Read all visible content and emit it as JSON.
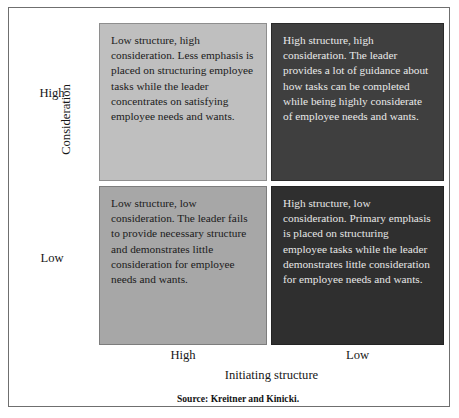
{
  "figure": {
    "axes": {
      "y_title": "Consideration",
      "y_ticks": {
        "high": "High",
        "low": "Low"
      },
      "x_title": "Initiating structure",
      "x_ticks": {
        "high": "High",
        "low": "Low"
      }
    },
    "quadrants": {
      "low_structure_high_consideration": "Low structure, high consideration. Less emphasis is placed on structuring employee tasks while the leader concentrates on satisfying employee needs and wants.",
      "high_structure_high_consideration": "High structure, high consideration. The leader provides a lot of guidance about how tasks can be completed while being highly considerate of employee needs and wants.",
      "low_structure_low_consideration": "Low structure, low consideration. The leader fails to provide necessary structure and demonstrates little consideration for employee needs and wants.",
      "high_structure_low_consideration": "High structure, low consideration. Primary emphasis is placed on structuring employee tasks while the leader demonstrates little consideration for employee needs and wants."
    },
    "source": "Source: Kreitner and Kinicki.",
    "colors": {
      "quadrant_low_high_bg": "#bfbfbf",
      "quadrant_high_high_bg": "#3f3f3f",
      "quadrant_low_low_bg": "#a7a7a7",
      "quadrant_high_low_bg": "#2f2f2f",
      "frame_border": "#6f6f6f",
      "text_dark": "#1b1b1b",
      "text_light": "#e9e9e9"
    }
  },
  "chart_data": {
    "type": "table",
    "title": "",
    "xlabel": "Initiating structure",
    "ylabel": "Consideration",
    "x_categories": [
      "High",
      "Low"
    ],
    "y_categories": [
      "High",
      "Low"
    ],
    "grid": false,
    "legend": "none",
    "cells": [
      {
        "row": "High",
        "column": "High",
        "fill": "#bfbfbf",
        "text_color": "#1b1b1b",
        "label": "Low structure, high consideration. Less emphasis is placed on structuring employee tasks while the leader concentrates on satisfying employee needs and wants."
      },
      {
        "row": "High",
        "column": "Low",
        "fill": "#3f3f3f",
        "text_color": "#e9e9e9",
        "label": "High structure, high consideration. The leader provides a lot of guidance about how tasks can be completed while being highly considerate of employee needs and wants."
      },
      {
        "row": "Low",
        "column": "High",
        "fill": "#a7a7a7",
        "text_color": "#1b1b1b",
        "label": "Low structure, low consideration. The leader fails to provide necessary structure and demonstrates little consideration for employee needs and wants."
      },
      {
        "row": "Low",
        "column": "Low",
        "fill": "#2f2f2f",
        "text_color": "#e6e6e6",
        "label": "High structure, low consideration. Primary emphasis is placed on structuring employee tasks while the leader demonstrates little consideration for employee needs and wants."
      }
    ],
    "annotations": [
      "Source: Kreitner and Kinicki."
    ]
  }
}
